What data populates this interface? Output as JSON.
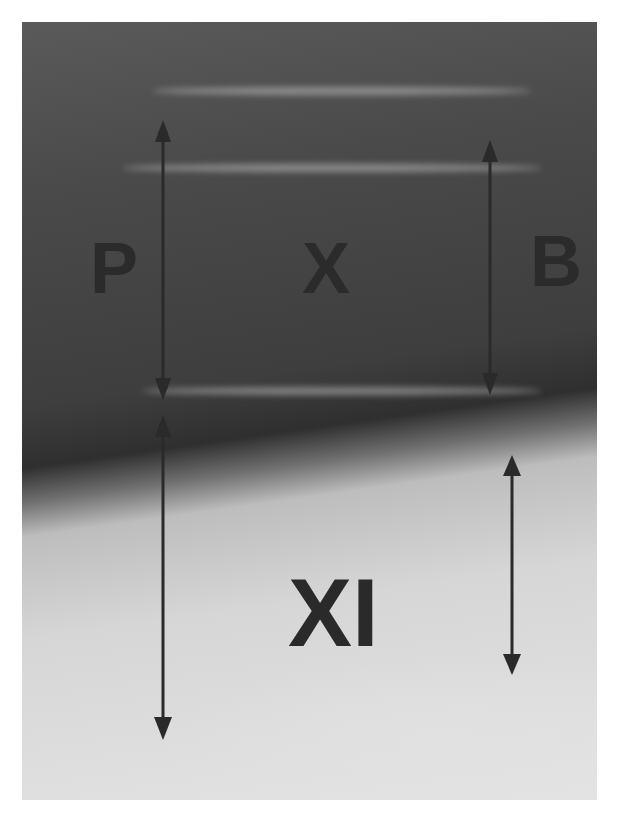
{
  "image": {
    "description": "Grayscale radiograph with annotated vertebral segments and measurement arrows",
    "labels": {
      "p": "P",
      "x": "X",
      "b": "B",
      "xi": "XI"
    },
    "arrows": [
      {
        "name": "left-upper",
        "x": 163,
        "y1": 120,
        "y2": 400
      },
      {
        "name": "left-lower",
        "x": 163,
        "y1": 415,
        "y2": 740
      },
      {
        "name": "right-upper",
        "x": 490,
        "y1": 140,
        "y2": 395
      },
      {
        "name": "right-lower",
        "x": 512,
        "y1": 455,
        "y2": 675
      }
    ],
    "colors": {
      "arrow": "#2a2a2a",
      "label": "#2a2a2a"
    }
  }
}
